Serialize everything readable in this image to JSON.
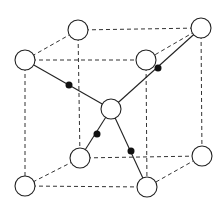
{
  "diagram": {
    "type": "crystal-unit-cell",
    "colors": {
      "edge": "#333333",
      "bond": "#222222",
      "large_atom_fill": "#ffffff",
      "small_atom_fill": "#111111"
    },
    "corner_atoms": [
      {
        "id": "top-left-back",
        "cx": 78,
        "cy": 30
      },
      {
        "id": "top-right-back",
        "cx": 201,
        "cy": 28
      },
      {
        "id": "top-left-front",
        "cx": 25,
        "cy": 60
      },
      {
        "id": "top-right-front",
        "cx": 146,
        "cy": 60
      },
      {
        "id": "bottom-left-back",
        "cx": 80,
        "cy": 158
      },
      {
        "id": "bottom-right-back",
        "cx": 202,
        "cy": 156
      },
      {
        "id": "bottom-left-front",
        "cx": 25,
        "cy": 186
      },
      {
        "id": "bottom-right-front",
        "cx": 147,
        "cy": 187
      }
    ],
    "center_atom": {
      "cx": 111,
      "cy": 109
    },
    "atom_radius": 10,
    "small_atoms": [
      {
        "cx": 69,
        "cy": 85
      },
      {
        "cx": 158,
        "cy": 68
      },
      {
        "cx": 97,
        "cy": 134
      },
      {
        "cx": 131,
        "cy": 151
      }
    ],
    "small_atom_radius": 3.5
  }
}
